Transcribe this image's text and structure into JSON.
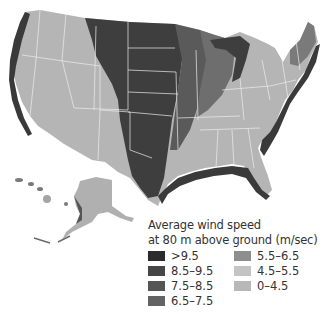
{
  "map": {
    "title": "Average wind speed at 80 m above ground",
    "region": "United States (contiguous, Alaska, Hawaii)"
  },
  "legend": {
    "title_line1": "Average wind speed",
    "title_line2": "at 80 m above ground (m/sec)",
    "items": [
      {
        "label": ">9.5",
        "color": "#2b2b2b"
      },
      {
        "label": "8.5–9.5",
        "color": "#464646"
      },
      {
        "label": "7.5–8.5",
        "color": "#555555"
      },
      {
        "label": "6.5–7.5",
        "color": "#636363"
      },
      {
        "label": "5.5–6.5",
        "color": "#8e8e8e"
      },
      {
        "label": "4.5–5.5",
        "color": "#c4c4c4"
      },
      {
        "label": "0–4.5",
        "color": "#b8b8b8"
      }
    ]
  },
  "colors": {
    "background": "#ffffff",
    "high_wind": "#3e3e3e",
    "mid_wind": "#6e6e6e",
    "low_wind": "#b5b5b5",
    "state_borders": "#e8e8e8"
  }
}
